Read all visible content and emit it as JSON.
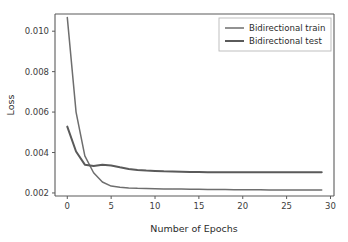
{
  "chart_data": {
    "type": "line",
    "title": "",
    "xlabel": "Number of Epochs",
    "ylabel": "Loss",
    "xlim": [
      -1.4,
      30.4
    ],
    "ylim": [
      0.00185,
      0.01085
    ],
    "xticks": [
      0,
      5,
      10,
      15,
      20,
      25,
      30
    ],
    "xtick_labels": [
      "0",
      "5",
      "10",
      "15",
      "20",
      "25",
      "30"
    ],
    "yticks": [
      0.002,
      0.004,
      0.006,
      0.008,
      0.01
    ],
    "ytick_labels": [
      "0.002",
      "0.004",
      "0.006",
      "0.008",
      "0.010"
    ],
    "grid": false,
    "legend_position": "upper right",
    "x": [
      0,
      1,
      2,
      3,
      4,
      5,
      6,
      7,
      8,
      9,
      10,
      11,
      12,
      13,
      14,
      15,
      16,
      17,
      18,
      19,
      20,
      21,
      22,
      23,
      24,
      25,
      26,
      27,
      28,
      29
    ],
    "series": [
      {
        "name": "Bidirectional train",
        "color": "#6e6e6e",
        "values": [
          0.01068,
          0.006,
          0.00383,
          0.003,
          0.00254,
          0.00234,
          0.00228,
          0.00225,
          0.00223,
          0.00222,
          0.00221,
          0.0022,
          0.00219,
          0.00219,
          0.00218,
          0.00218,
          0.00217,
          0.00217,
          0.00217,
          0.00216,
          0.00216,
          0.00216,
          0.00216,
          0.00215,
          0.00215,
          0.00215,
          0.00215,
          0.00215,
          0.00215,
          0.00215
        ]
      },
      {
        "name": "Bidirectional test",
        "color": "#5a5a5a",
        "values": [
          0.00528,
          0.00405,
          0.0034,
          0.00333,
          0.0034,
          0.00336,
          0.00327,
          0.00319,
          0.00314,
          0.00311,
          0.00309,
          0.00307,
          0.00306,
          0.00305,
          0.00304,
          0.00304,
          0.00303,
          0.00303,
          0.00303,
          0.00303,
          0.00302,
          0.00302,
          0.00302,
          0.00302,
          0.00302,
          0.00302,
          0.00302,
          0.00302,
          0.00302,
          0.00302
        ]
      }
    ]
  },
  "legend": {
    "entries": [
      {
        "label": "Bidirectional train"
      },
      {
        "label": "Bidirectional test"
      }
    ]
  },
  "axes": {
    "x_title": "Number of Epochs",
    "y_title": "Loss"
  },
  "colors": {
    "train_line": "#6e6e6e",
    "test_line": "#5a5a5a",
    "axis": "#5b5b5b",
    "text": "#2b2b2b",
    "background": "#ffffff"
  }
}
